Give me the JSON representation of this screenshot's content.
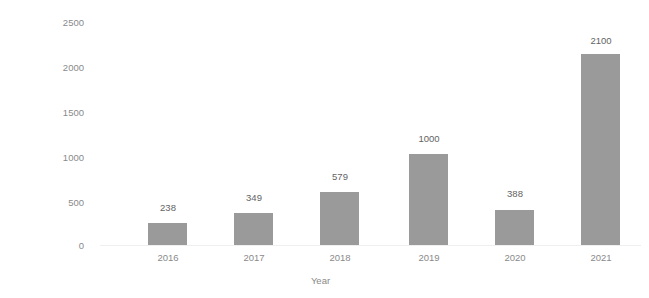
{
  "chart_data": {
    "type": "bar",
    "title": "",
    "categories": [
      "2016",
      "2017",
      "2018",
      "2019",
      "2020",
      "2021"
    ],
    "values": [
      238,
      349,
      579,
      1000,
      388,
      2100
    ],
    "data_labels": [
      "238",
      "349",
      "579",
      "1000",
      "388",
      "2100"
    ],
    "xlabel": "Year",
    "ylabel": "Funding (in million $)",
    "ylim": [
      0,
      2500
    ],
    "ytick_labels": [
      "2500",
      "2000",
      "1500",
      "1000",
      "500",
      "0"
    ],
    "ytick_values": [
      2500,
      2000,
      1500,
      1000,
      500,
      0
    ],
    "grid": false,
    "legend": false,
    "bar_color": "#9a9a9a",
    "tick_label_color": "#8a8a8a",
    "data_label_color": "#636363",
    "axis_title_color": "#3d3d3d",
    "baseline_color": "#f0eeee",
    "background_color": "#ffffff"
  }
}
